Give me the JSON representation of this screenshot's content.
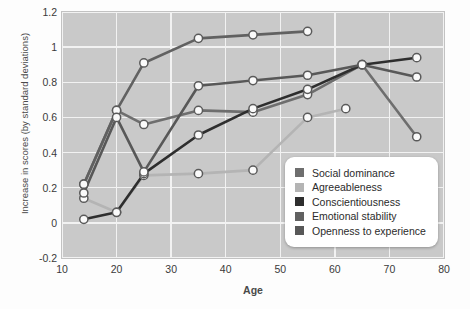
{
  "chart_data": {
    "type": "line",
    "title": "",
    "xlabel": "Age",
    "ylabel": "Increase in scores (by standard deviations)",
    "xlim": [
      10,
      80
    ],
    "ylim": [
      -0.2,
      1.2
    ],
    "xticks": [
      "10",
      "20",
      "30",
      "40",
      "50",
      "60",
      "70",
      "80"
    ],
    "yticks": [
      "1.2",
      "1",
      "0.8",
      "0.6",
      "0.4",
      "0.2",
      "0",
      "-0.2"
    ],
    "grid": true,
    "legend_position": "inside-bottom-right",
    "plot_background": "#c9c9c9",
    "series": [
      {
        "name": "Social dominance",
        "color": "#6e6e6e",
        "x": [
          14,
          20,
          25,
          35,
          45,
          55,
          65,
          75
        ],
        "values": [
          0.22,
          0.64,
          0.56,
          0.64,
          0.63,
          0.73,
          0.9,
          0.49
        ]
      },
      {
        "name": "Agreeableness",
        "color": "#b4b4b4",
        "x": [
          14,
          20,
          25,
          35,
          45,
          55,
          62
        ],
        "values": [
          0.14,
          0.06,
          0.27,
          0.28,
          0.3,
          0.6,
          0.65
        ]
      },
      {
        "name": "Conscientiousness",
        "color": "#2e2e2e",
        "x": [
          14,
          20,
          25,
          35,
          45,
          55,
          65,
          75
        ],
        "values": [
          0.02,
          0.06,
          0.28,
          0.5,
          0.65,
          0.76,
          0.9,
          0.94
        ]
      },
      {
        "name": "Emotional stability",
        "color": "#616161",
        "x": [
          14,
          20,
          25,
          35,
          45,
          55
        ],
        "values": [
          0.22,
          0.64,
          0.91,
          1.05,
          1.07,
          1.09
        ]
      },
      {
        "name": "Openness to experience",
        "color": "#585858",
        "x": [
          14,
          20,
          25,
          35,
          45,
          55,
          65,
          75
        ],
        "values": [
          0.17,
          0.6,
          0.29,
          0.78,
          0.81,
          0.84,
          0.9,
          0.83
        ]
      }
    ]
  },
  "legend": {
    "items": [
      {
        "label": "Social dominance"
      },
      {
        "label": "Agreeableness"
      },
      {
        "label": "Conscientiousness"
      },
      {
        "label": "Emotional stability"
      },
      {
        "label": "Openness to experience"
      }
    ]
  }
}
